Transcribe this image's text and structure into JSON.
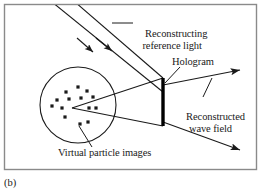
{
  "figure": {
    "caption": "(b)",
    "background_color": "#ffffff",
    "frame": {
      "color": "#8a8a8a",
      "x": 4,
      "y": 4,
      "width": 253,
      "height": 166
    },
    "labels": {
      "reconstructing_reference_light": {
        "line1": "Reconstructing",
        "line2": "reference light"
      },
      "hologram": "Hologram",
      "reconstructed_wave_field": {
        "line1": "Reconstructed",
        "line2": "wave field"
      },
      "virtual_particle_images": "Virtual particle images"
    },
    "ink_color": "#1a1a1a",
    "diagram": {
      "circle": {
        "cx": 78,
        "cy": 105,
        "r": 38,
        "stroke": "#1a1a1a"
      },
      "hologram_bar": {
        "x": 163,
        "y1": 78,
        "y2": 126,
        "width": 3,
        "color": "#000000"
      },
      "apex": {
        "x": 72,
        "y": 108
      },
      "reference_beams": [
        {
          "x1": 52,
          "y1": 4,
          "x2": 163,
          "y2": 92
        },
        {
          "x1": 75,
          "y1": 4,
          "x2": 163,
          "y2": 78
        }
      ],
      "reconstructed_rays": [
        {
          "x1": 163,
          "y1": 84,
          "x2": 243,
          "y2": 70
        },
        {
          "x1": 163,
          "y1": 122,
          "x2": 243,
          "y2": 150
        }
      ],
      "wedge_lines": [
        {
          "x1": 72,
          "y1": 108,
          "x2": 163,
          "y2": 78
        },
        {
          "x1": 72,
          "y1": 108,
          "x2": 163,
          "y2": 126
        }
      ],
      "particles": [
        {
          "x": 66,
          "y": 92
        },
        {
          "x": 78,
          "y": 87
        },
        {
          "x": 87,
          "y": 91
        },
        {
          "x": 57,
          "y": 100
        },
        {
          "x": 69,
          "y": 99
        },
        {
          "x": 81,
          "y": 98
        },
        {
          "x": 93,
          "y": 97
        },
        {
          "x": 52,
          "y": 106
        },
        {
          "x": 62,
          "y": 108
        },
        {
          "x": 89,
          "y": 108
        },
        {
          "x": 96,
          "y": 108
        },
        {
          "x": 65,
          "y": 117
        },
        {
          "x": 80,
          "y": 124
        },
        {
          "x": 88,
          "y": 122
        }
      ],
      "particle_size": 3.2,
      "leader_lines": [
        {
          "name": "reference-leader",
          "x1": 133,
          "y1": 22,
          "x2": 113,
          "y2": 22
        },
        {
          "name": "hologram-leader",
          "x1": 178,
          "y1": 68,
          "x2": 164,
          "y2": 82
        },
        {
          "name": "wave-field-leader",
          "x1": 204,
          "y1": 96,
          "x2": 212,
          "y2": 78
        },
        {
          "name": "virtual-leader",
          "x1": 90,
          "y1": 146,
          "x2": 79,
          "y2": 127
        }
      ]
    }
  }
}
